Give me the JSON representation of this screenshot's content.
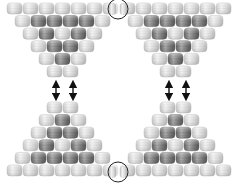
{
  "diagram": {
    "colors": {
      "background": "#ffffff",
      "light_bead": "#dcdcdc",
      "light_bead_edge": "#f4f4f4",
      "dark_bead": "#7a7a7a",
      "dark_bead_edge": "#b8b8b8",
      "outline": "#c8c8c8",
      "arrow": "#111111",
      "circle": "#222222"
    },
    "bead": {
      "width": 15,
      "height": 11,
      "pitch_x": 16,
      "pitch_y": 12.6
    },
    "triangles": [
      {
        "name": "top-left",
        "orientation": "down",
        "origin_x": 7,
        "origin_y": 3,
        "rows": [
          "LLLLLLL",
          "LDDDDL",
          "LDLDL",
          "LDDL",
          "LDL",
          "LL"
        ]
      },
      {
        "name": "top-right",
        "orientation": "down",
        "origin_x": 120,
        "origin_y": 3,
        "rows": [
          "LLLLLLL",
          "LDDDDL",
          "LDLDL",
          "LDDL",
          "LDL",
          "LL"
        ]
      },
      {
        "name": "bottom-left",
        "orientation": "up",
        "origin_x": 7,
        "origin_y": 102,
        "rows": [
          "LL",
          "LDL",
          "LDDL",
          "LDLDL",
          "LDDDDL",
          "LLLLLLL"
        ]
      },
      {
        "name": "bottom-right",
        "orientation": "up",
        "origin_x": 120,
        "origin_y": 102,
        "rows": [
          "LL",
          "LDL",
          "LDDL",
          "LDLDL",
          "LDDDDL",
          "LLLLLLL"
        ]
      }
    ],
    "arrows": [
      {
        "name": "arrow-left-1",
        "x": 56,
        "y1": 81,
        "y2": 100
      },
      {
        "name": "arrow-left-2",
        "x": 73,
        "y1": 81,
        "y2": 100
      },
      {
        "name": "arrow-right-1",
        "x": 169,
        "y1": 81,
        "y2": 100
      },
      {
        "name": "arrow-right-2",
        "x": 186,
        "y1": 81,
        "y2": 100
      }
    ],
    "circles": [
      {
        "name": "join-circle-top",
        "cx": 118,
        "cy": 9,
        "r": 10
      },
      {
        "name": "join-circle-bottom",
        "cx": 118,
        "cy": 172,
        "r": 10
      }
    ]
  }
}
